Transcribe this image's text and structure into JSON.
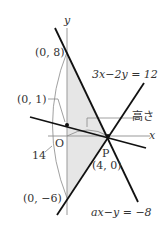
{
  "diagram": {
    "axes": {
      "x_label": "x",
      "y_label": "y",
      "origin_label": "O"
    },
    "points": {
      "y_intercept_top": "(0, 8)",
      "y_intercept_mid": "(0, 1)",
      "y_intercept_bottom": "(0, −6)",
      "P_name": "P",
      "P_coords": "(4, 0)"
    },
    "equations": {
      "line1": "3x−2y = 12",
      "line2": "ax−y = −8"
    },
    "annotations": {
      "height": "高さ",
      "length": "14"
    },
    "colors": {
      "line": "#111111",
      "axis": "#999999",
      "shade": "#e6e6e6",
      "text": "#333333"
    }
  }
}
